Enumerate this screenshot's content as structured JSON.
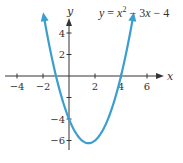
{
  "chart_data": {
    "type": "line",
    "function": {
      "a": 1,
      "b": -3,
      "c": -4
    },
    "x_range": [
      -1.95,
      4.95
    ],
    "xlabel": "x",
    "ylabel": "y",
    "x_ticks": [
      -4,
      -2,
      2,
      4,
      6
    ],
    "x_tick_labels": [
      "−4",
      "−2",
      "2",
      "4",
      "6"
    ],
    "y_ticks": [
      4,
      2,
      -2,
      -4,
      -6
    ],
    "y_tick_labels": [
      "4",
      "2",
      "",
      "−4",
      "−6"
    ],
    "xlim": [
      -4.5,
      7.5
    ],
    "ylim": [
      -6.8,
      6.5
    ],
    "grid": false,
    "vertex": [
      1.5,
      -6.25
    ],
    "roots": [
      -1,
      4
    ],
    "y_intercept": -4,
    "curve_color": "#3a9fd0",
    "axis_color": "#333333"
  },
  "equation": {
    "lhs": "y",
    "eq": " = ",
    "x": "x",
    "exp": "2",
    "rest1": " − 3",
    "x2": "x",
    "rest2": " − 4"
  }
}
